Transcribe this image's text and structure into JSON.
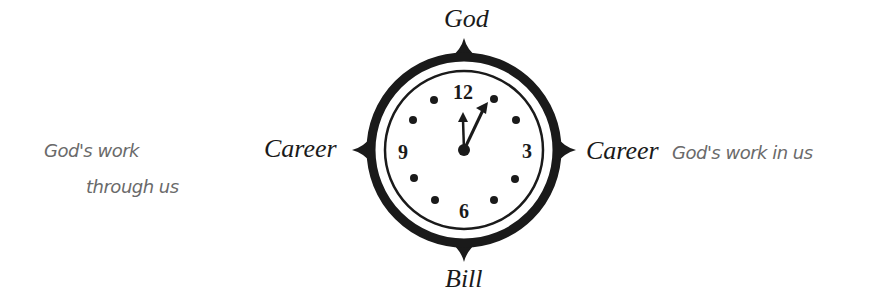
{
  "diagram": {
    "type": "clock-compass",
    "labels": {
      "top": "God",
      "bottom": "Bill",
      "left": "Career",
      "right": "Career"
    },
    "clock": {
      "numbers": [
        "12",
        "3",
        "6",
        "9"
      ],
      "time_shown": "approx 12:05",
      "hour_dots": 8
    },
    "annotations": {
      "left_line1": "God's work",
      "left_line2": "through us",
      "right": "God's work in us"
    },
    "colors": {
      "ink": "#1a1a1a",
      "handwriting": "#6a6a6a",
      "background": "#ffffff"
    }
  }
}
